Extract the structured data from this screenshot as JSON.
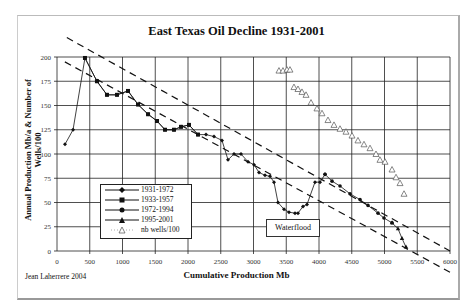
{
  "chart_data": {
    "type": "line",
    "title": "East Texas Oil Decline 1931-2001",
    "xlabel": "Cumulative Production Mb",
    "ylabel": "Annual Production Mb/a & Number of Wells/100",
    "xlim": [
      0,
      6000
    ],
    "ylim": [
      0,
      200
    ],
    "xticks": [
      0,
      500,
      1000,
      1500,
      2000,
      2500,
      3000,
      3500,
      4000,
      4500,
      5000,
      5500,
      6000
    ],
    "yticks": [
      0,
      25,
      50,
      75,
      100,
      125,
      150,
      175,
      200
    ],
    "grid": true,
    "legend_position": "inside lower-left",
    "series": [
      {
        "name": "1931-1972",
        "marker": "diamond",
        "points": [
          [
            122,
            110
          ],
          [
            245,
            125
          ],
          [
            427,
            199
          ],
          [
            610,
            175
          ],
          [
            763,
            161
          ],
          [
            916,
            161
          ],
          [
            1084,
            165
          ],
          [
            1237,
            151
          ],
          [
            1390,
            141
          ],
          [
            1527,
            134
          ],
          [
            1649,
            125
          ],
          [
            1786,
            125
          ],
          [
            1893,
            128
          ],
          [
            2015,
            130
          ],
          [
            2153,
            120
          ],
          [
            2275,
            120
          ],
          [
            2397,
            118
          ],
          [
            2519,
            114
          ],
          [
            2611,
            94
          ],
          [
            2702,
            100
          ],
          [
            2809,
            100
          ],
          [
            2916,
            92
          ],
          [
            3008,
            89
          ],
          [
            3084,
            81
          ],
          [
            3176,
            78
          ],
          [
            3252,
            77
          ],
          [
            3313,
            71
          ],
          [
            3374,
            50
          ],
          [
            3466,
            43
          ],
          [
            3542,
            40
          ],
          [
            3634,
            39
          ],
          [
            3679,
            39
          ],
          [
            3756,
            46
          ],
          [
            3817,
            48
          ],
          [
            3939,
            71
          ],
          [
            4015,
            71
          ],
          [
            4092,
            79
          ]
        ]
      },
      {
        "name": "1933-1957",
        "marker": "square",
        "points": [
          [
            427,
            199
          ],
          [
            610,
            175
          ],
          [
            763,
            161
          ],
          [
            916,
            161
          ],
          [
            1084,
            165
          ],
          [
            1237,
            151
          ],
          [
            1390,
            141
          ],
          [
            1527,
            134
          ],
          [
            1649,
            125
          ],
          [
            1786,
            125
          ],
          [
            1893,
            128
          ],
          [
            2015,
            130
          ],
          [
            2153,
            120
          ]
        ]
      },
      {
        "name": "1972-1994",
        "marker": "circle",
        "points": [
          [
            4092,
            79
          ],
          [
            4199,
            72
          ],
          [
            4321,
            67
          ],
          [
            4473,
            59
          ],
          [
            4626,
            53
          ],
          [
            4748,
            47
          ],
          [
            4901,
            39
          ],
          [
            4992,
            34
          ],
          [
            5115,
            29
          ]
        ]
      },
      {
        "name": "1995-2001",
        "marker": "triangle",
        "points": [
          [
            5115,
            29
          ],
          [
            5206,
            23
          ],
          [
            5267,
            13
          ],
          [
            5328,
            4
          ]
        ]
      },
      {
        "name": "nb wells/100",
        "marker": "open-triangle",
        "points": [
          [
            3389,
            186
          ],
          [
            3450,
            186
          ],
          [
            3511,
            187
          ],
          [
            3557,
            187
          ],
          [
            3618,
            169
          ],
          [
            3679,
            167
          ],
          [
            3740,
            164
          ],
          [
            3802,
            161
          ],
          [
            3878,
            153
          ],
          [
            3969,
            147
          ],
          [
            4046,
            142
          ],
          [
            4137,
            135
          ],
          [
            4229,
            130
          ],
          [
            4321,
            126
          ],
          [
            4412,
            123
          ],
          [
            4504,
            119
          ],
          [
            4595,
            114
          ],
          [
            4687,
            110
          ],
          [
            4779,
            106
          ],
          [
            4870,
            100
          ],
          [
            4931,
            94
          ],
          [
            5008,
            92
          ],
          [
            5115,
            84
          ],
          [
            5176,
            76
          ],
          [
            5237,
            70
          ],
          [
            5298,
            59
          ]
        ]
      }
    ],
    "trendlines": [
      {
        "style": "dashed",
        "from": [
          150,
          220
        ],
        "to": [
          6000,
          0
        ]
      },
      {
        "style": "dashed",
        "from": [
          120,
          195
        ],
        "to": [
          6000,
          -22
        ]
      }
    ],
    "annotations": [
      {
        "text": "Waterflood",
        "x": 3700,
        "y": 20
      }
    ]
  },
  "credit": "Jean Laherrere 2004"
}
